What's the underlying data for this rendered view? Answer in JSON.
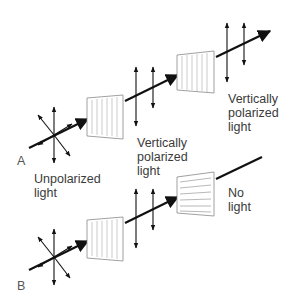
{
  "diagram": {
    "panels": [
      {
        "id": "A",
        "label": "A",
        "source_label_line1": "Unpolarized",
        "source_label_line2": "light",
        "filter1": "vertical",
        "mid_label_line1": "Vertically",
        "mid_label_line2": "polarized",
        "mid_label_line3": "light",
        "filter2": "vertical",
        "out_label_line1": "Vertically",
        "out_label_line2": "polarized",
        "out_label_line3": "light"
      },
      {
        "id": "B",
        "label": "B",
        "filter1": "vertical",
        "filter2": "horizontal",
        "out_label_line1": "No",
        "out_label_line2": "light"
      }
    ],
    "colors": {
      "ray": "#111111",
      "filter_stroke": "#888888",
      "text": "#3a3a3a"
    }
  }
}
